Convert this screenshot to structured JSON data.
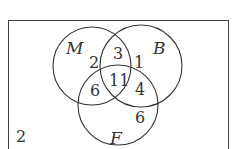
{
  "diagram": {
    "type": "venn",
    "sets": [
      {
        "name": "M"
      },
      {
        "name": "B"
      },
      {
        "name": "F"
      }
    ],
    "regions": {
      "M_only": "2",
      "B_only": "1",
      "F_only": "6",
      "M_and_B_only": "3",
      "M_and_F_only": "6",
      "B_and_F_only": "4",
      "M_and_B_and_F": "11",
      "outside": "2"
    },
    "colors": {
      "stroke": "#333333",
      "background": "#ffffff"
    }
  }
}
